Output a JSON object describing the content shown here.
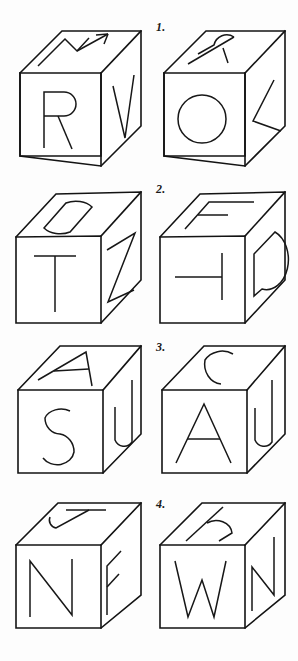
{
  "page": {
    "background_color": "#fdfdfd",
    "ink_color": "#131313",
    "rows": 4,
    "cubes_per_row": 2
  },
  "rows": [
    {
      "number_label": "1.",
      "left_cube": {
        "name": "cube-1-left",
        "top_letter": "M",
        "front_letter": "R",
        "right_letter": "V"
      },
      "right_cube": {
        "name": "cube-1-right",
        "top_letter": "R",
        "front_letter": "O",
        "right_letter": "L"
      }
    },
    {
      "number_label": "2.",
      "left_cube": {
        "name": "cube-2-left",
        "top_letter": "D",
        "front_letter": "T",
        "right_letter": "Z"
      },
      "right_cube": {
        "name": "cube-2-right",
        "top_letter": "F",
        "front_letter": "T",
        "right_letter": "D"
      }
    },
    {
      "number_label": "3.",
      "left_cube": {
        "name": "cube-3-left",
        "top_letter": "A",
        "front_letter": "S",
        "right_letter": "U"
      },
      "right_cube": {
        "name": "cube-3-right",
        "top_letter": "C",
        "front_letter": "A",
        "right_letter": "U"
      }
    },
    {
      "number_label": "4.",
      "left_cube": {
        "name": "cube-4-left",
        "top_letter": "J",
        "front_letter": "N",
        "right_letter": "F"
      },
      "right_cube": {
        "name": "cube-4-right",
        "top_letter": "h",
        "front_letter": "W",
        "right_letter": "N"
      }
    }
  ]
}
